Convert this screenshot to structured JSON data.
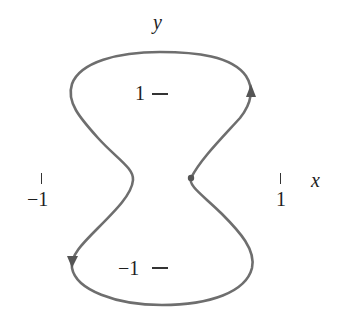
{
  "figure": {
    "type": "parametric closed curve (hourglass / figure-eight-like loop)",
    "curve_color": "#6e6e6e",
    "axes": {
      "x_label": "x",
      "y_label": "y"
    },
    "ticks": {
      "x_neg": "−1",
      "x_pos": "1",
      "y_pos": "1",
      "y_neg": "−1"
    },
    "markers": {
      "start_point": "dot on right waist",
      "arrow_upper_right": "up",
      "arrow_lower_left": "down"
    }
  }
}
